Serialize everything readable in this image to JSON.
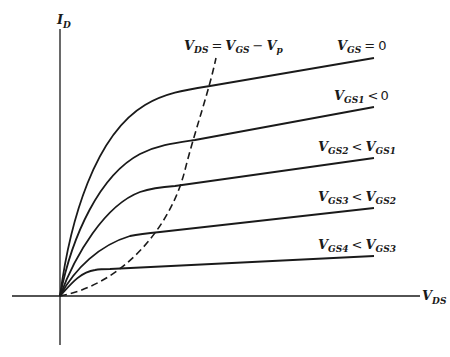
{
  "figure": {
    "y_axis": {
      "main": "I",
      "sub": "D"
    },
    "x_axis": {
      "main": "V",
      "sub": "DS"
    },
    "pinchoff_locus": {
      "label_parts": [
        "V",
        "DS",
        "=",
        "V",
        "GS",
        "−",
        "V",
        "p"
      ],
      "style": "dashed"
    },
    "curves": [
      {
        "id": "vgs0",
        "label_left": {
          "main": "V",
          "sub": "GS"
        },
        "op": "=",
        "label_right": {
          "main": "0",
          "sub": ""
        }
      },
      {
        "id": "vgs1",
        "label_left": {
          "main": "V",
          "sub": "GS1"
        },
        "op": "<",
        "label_right": {
          "main": "0",
          "sub": ""
        }
      },
      {
        "id": "vgs2",
        "label_left": {
          "main": "V",
          "sub": "GS2"
        },
        "op": "<",
        "label_right": {
          "main": "V",
          "sub": "GS1"
        }
      },
      {
        "id": "vgs3",
        "label_left": {
          "main": "V",
          "sub": "GS3"
        },
        "op": "<",
        "label_right": {
          "main": "V",
          "sub": "GS2"
        }
      },
      {
        "id": "vgs4",
        "label_left": {
          "main": "V",
          "sub": "GS4"
        },
        "op": "<",
        "label_right": {
          "main": "V",
          "sub": "GS3"
        }
      }
    ]
  },
  "colors": {
    "line": "#1a1a1a",
    "background": "#ffffff"
  }
}
